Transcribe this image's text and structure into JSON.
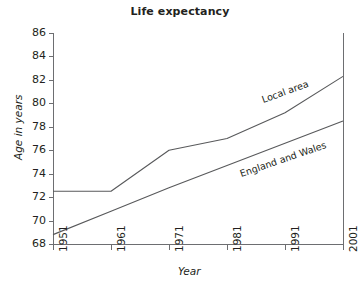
{
  "chart_data": {
    "type": "line",
    "title": "Life expectancy",
    "xlabel": "Year",
    "ylabel": "Age in years",
    "x": [
      1951,
      1961,
      1971,
      1981,
      1991,
      2001
    ],
    "xtick_labels": [
      "1951",
      "1961",
      "1971",
      "1981",
      "1991",
      "2001"
    ],
    "ytick_labels": [
      "68",
      "70",
      "72",
      "74",
      "76",
      "78",
      "80",
      "82",
      "84",
      "86"
    ],
    "yticks": [
      68,
      70,
      72,
      74,
      76,
      78,
      80,
      82,
      84,
      86
    ],
    "xlim": [
      1951,
      2001
    ],
    "ylim": [
      68,
      86
    ],
    "grid": false,
    "legend_position": "inline-annotation",
    "series": [
      {
        "name": "Local area",
        "label": "Local area",
        "color": "#58595b",
        "values": [
          72.5,
          72.5,
          76.0,
          77.0,
          79.2,
          82.3
        ]
      },
      {
        "name": "England and Wales",
        "label": "England and Wales",
        "color": "#58595b",
        "values": [
          68.8,
          70.8,
          72.8,
          74.7,
          76.6,
          78.5
        ]
      }
    ]
  },
  "colors": {
    "axis": "#6d6e71",
    "line": "#58595b",
    "text": "#231f20",
    "background": "#ffffff"
  }
}
